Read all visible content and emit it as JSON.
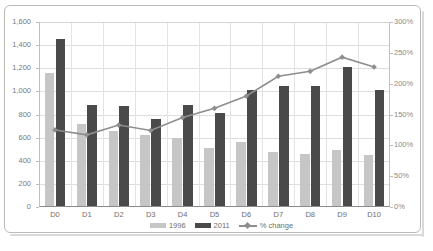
{
  "chart_data": {
    "type": "bar",
    "title": "",
    "subtitle": "",
    "xlabel": "",
    "ylabel": "",
    "y2label": "",
    "categories": [
      "D0",
      "D1",
      "D2",
      "D3",
      "D4",
      "D5",
      "D6",
      "D7",
      "D8",
      "D9",
      "D10"
    ],
    "series": [
      {
        "name": "1996",
        "type": "bar",
        "color": "#c6c6c6",
        "axis": "left",
        "values": [
          1160,
          715,
          660,
          620,
          595,
          510,
          560,
          480,
          460,
          495,
          450
        ]
      },
      {
        "name": "2011",
        "type": "bar",
        "color": "#4a4a4a",
        "axis": "left",
        "values": [
          1450,
          880,
          870,
          760,
          880,
          810,
          1010,
          1045,
          1045,
          1215,
          1010
        ]
      },
      {
        "name": "% change",
        "type": "line",
        "color": "#8e8e8e",
        "axis": "right",
        "values": [
          125,
          117,
          133,
          124,
          145,
          160,
          180,
          212,
          220,
          243,
          227
        ]
      }
    ],
    "ylim": [
      0,
      1600
    ],
    "yticks": [
      0,
      200,
      400,
      600,
      800,
      1000,
      1200,
      1400,
      1600
    ],
    "ytick_labels": [
      "0",
      "200",
      "400",
      "600",
      "800",
      "1,000",
      "1,200",
      "1,400",
      "1,600"
    ],
    "y2lim": [
      0,
      300
    ],
    "y2ticks": [
      0,
      50,
      100,
      150,
      200,
      250,
      300
    ],
    "y2tick_labels": [
      "0%",
      "50%",
      "100%",
      "150%",
      "200%",
      "250%",
      "300%"
    ],
    "grid": true,
    "legend_position": "bottom",
    "legend": [
      "1996",
      "2011",
      "% change"
    ]
  }
}
